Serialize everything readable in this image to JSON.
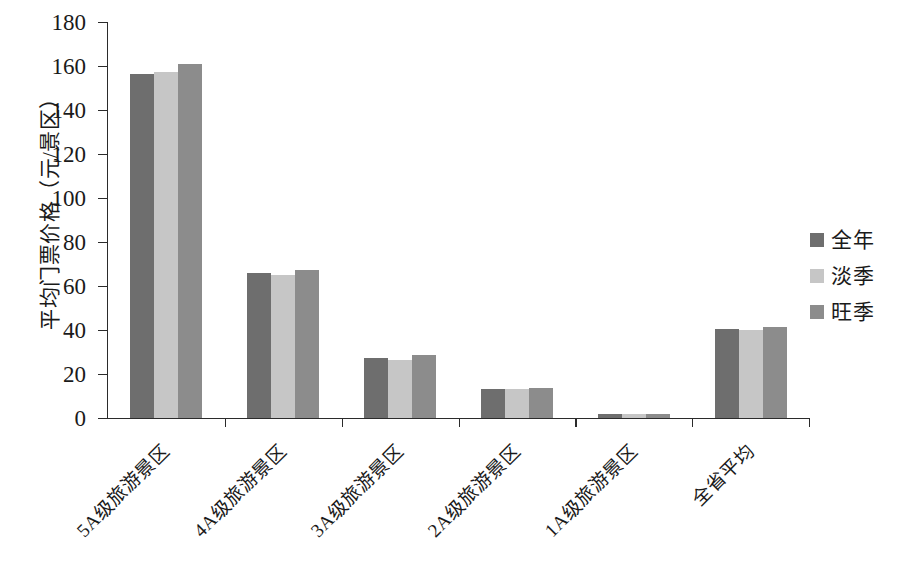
{
  "chart_data": {
    "type": "bar",
    "title": "",
    "subtitle": "",
    "xlabel": "",
    "ylabel": "平均门票价格（元/景区）",
    "ylim": [
      0,
      180
    ],
    "ytick_step": 20,
    "ytick_labels": [
      "180",
      "160",
      "140",
      "120",
      "100",
      "80",
      "60",
      "40",
      "20",
      "0"
    ],
    "grid": false,
    "legend_position": "right",
    "categories": [
      "5A级旅游景区",
      "4A级旅游景区",
      "3A级旅游景区",
      "2A级旅游景区",
      "1A级旅游景区",
      "全省平均"
    ],
    "series": [
      {
        "name": "全年",
        "color": "#6e6e6e",
        "values": [
          156.5,
          66.0,
          27.5,
          13.0,
          2.0,
          40.5
        ]
      },
      {
        "name": "淡季",
        "color": "#c6c6c6",
        "values": [
          157.5,
          65.0,
          26.5,
          13.0,
          1.8,
          40.0
        ]
      },
      {
        "name": "旺季",
        "color": "#8c8c8c",
        "values": [
          161.0,
          67.5,
          28.5,
          13.5,
          2.0,
          41.5
        ]
      }
    ]
  },
  "legend": {
    "items": [
      {
        "label": "全年",
        "color": "#6e6e6e"
      },
      {
        "label": "淡季",
        "color": "#c6c6c6"
      },
      {
        "label": "旺季",
        "color": "#8c8c8c"
      }
    ]
  },
  "axes": {
    "y_title": "平均门票价格（元/景区）",
    "y_ticks": [
      "180",
      "160",
      "140",
      "120",
      "100",
      "80",
      "60",
      "40",
      "20",
      "0"
    ],
    "x_ticks": [
      "5A级旅游景区",
      "4A级旅游景区",
      "3A级旅游景区",
      "2A级旅游景区",
      "1A级旅游景区",
      "全省平均"
    ]
  },
  "colors": {
    "series_full_year": "#6e6e6e",
    "series_off_season": "#c6c6c6",
    "series_peak_season": "#8c8c8c",
    "axis": "#2b2b2b",
    "background": "#ffffff"
  }
}
